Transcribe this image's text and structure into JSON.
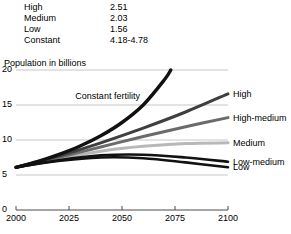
{
  "fertility_table": {
    "rows": [
      {
        "name": "High",
        "value": "2.51"
      },
      {
        "name": "Medium",
        "value": "2.03"
      },
      {
        "name": "Low",
        "value": "1.56"
      },
      {
        "name": "Constant",
        "value": "4.18-4.78"
      }
    ]
  },
  "chart_data": {
    "type": "line",
    "title": "",
    "ylabel": "Population in billions",
    "xlabel": "",
    "xlim": [
      2000,
      2100
    ],
    "ylim": [
      0,
      20
    ],
    "yticks": [
      "0",
      "5",
      "10",
      "15",
      "20"
    ],
    "xticks": [
      "2000",
      "2025",
      "2050",
      "2075",
      "2100"
    ],
    "grid": true,
    "legend_position": "right-inline",
    "annotations": [
      {
        "text": "Constant fertility",
        "x": 2028,
        "y": 16.3
      }
    ],
    "series": [
      {
        "name": "Constant fertility",
        "color": "#111111",
        "width": 3.4,
        "x": [
          2000,
          2010,
          2020,
          2030,
          2040,
          2050,
          2060,
          2070,
          2073
        ],
        "values": [
          6.1,
          6.9,
          7.9,
          9.1,
          10.6,
          12.5,
          15.0,
          18.6,
          20.0
        ]
      },
      {
        "name": "High",
        "color": "#3f3f3f",
        "width": 3.0,
        "x": [
          2000,
          2020,
          2040,
          2060,
          2080,
          2100
        ],
        "values": [
          6.1,
          7.7,
          9.6,
          11.7,
          14.0,
          16.6
        ]
      },
      {
        "name": "High-medium",
        "color": "#6b6b6b",
        "width": 3.0,
        "x": [
          2000,
          2020,
          2040,
          2060,
          2080,
          2100
        ],
        "values": [
          6.1,
          7.5,
          9.0,
          10.5,
          11.9,
          13.2
        ]
      },
      {
        "name": "Medium",
        "color": "#b8b8b8",
        "width": 3.0,
        "x": [
          2000,
          2020,
          2040,
          2060,
          2080,
          2100
        ],
        "values": [
          6.1,
          7.3,
          8.4,
          9.1,
          9.5,
          9.6
        ]
      },
      {
        "name": "Low-medium",
        "color": "#111111",
        "width": 2.6,
        "x": [
          2000,
          2020,
          2040,
          2060,
          2080,
          2100
        ],
        "values": [
          6.1,
          7.1,
          7.8,
          7.9,
          7.5,
          6.9
        ]
      },
      {
        "name": "Low",
        "color": "#111111",
        "width": 2.6,
        "x": [
          2000,
          2020,
          2040,
          2060,
          2080,
          2100
        ],
        "values": [
          6.1,
          7.0,
          7.5,
          7.4,
          6.8,
          6.1
        ]
      }
    ],
    "series_labels": [
      {
        "name": "High",
        "label": "High"
      },
      {
        "name": "High-medium",
        "label": "High-medium"
      },
      {
        "name": "Medium",
        "label": "Medium"
      },
      {
        "name": "Low-medium",
        "label": "Low-medium"
      },
      {
        "name": "Low",
        "label": "Low"
      }
    ]
  }
}
